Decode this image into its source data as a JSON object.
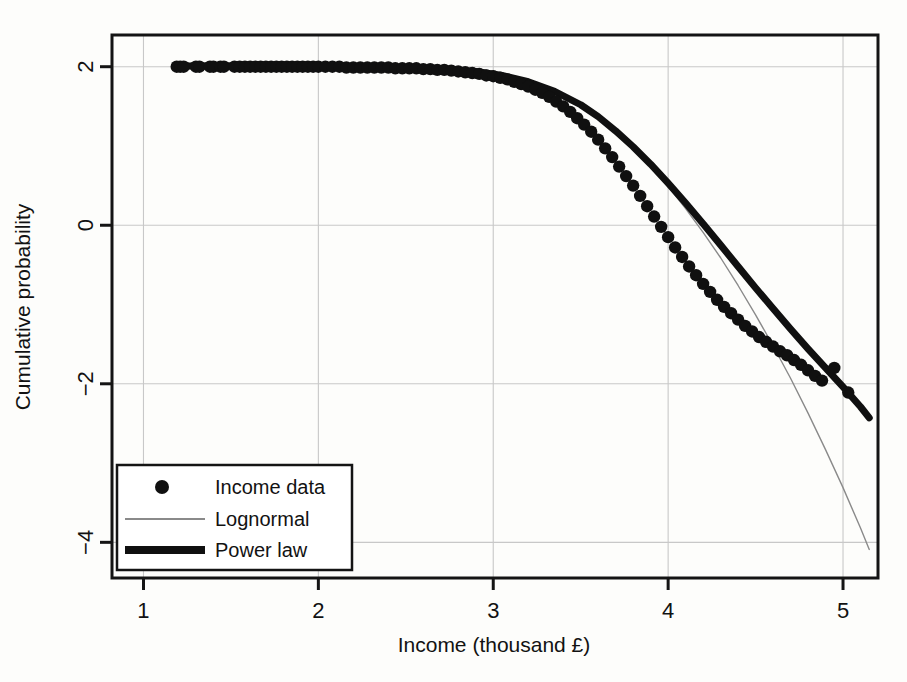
{
  "chart_data": {
    "type": "scatter",
    "title": "",
    "xlabel": "Income (thousand £)",
    "ylabel": "Cumulative probability",
    "xlim": [
      0.82,
      5.2
    ],
    "ylim": [
      -4.45,
      2.4
    ],
    "xticks": [
      1,
      2,
      3,
      4,
      5
    ],
    "yticks": [
      2,
      0,
      -2,
      -4
    ],
    "xticklabels": [
      "1",
      "2",
      "3",
      "4",
      "5"
    ],
    "yticklabels": [
      "2",
      "0",
      "−2",
      "−4"
    ],
    "grid": true,
    "grid_color": "#c8c8c8",
    "frame_color": "#141414",
    "background": "#fdfdfb",
    "legend": {
      "position": "bottom-left",
      "entries": [
        {
          "label": "Income data",
          "marker": "circle",
          "color": "#101010"
        },
        {
          "label": "Lognormal",
          "marker": "thin-line",
          "color": "#8a8a8a"
        },
        {
          "label": "Power law",
          "marker": "thick-line",
          "color": "#101010"
        }
      ]
    },
    "series": [
      {
        "name": "Income data",
        "type": "scatter",
        "marker": "circle",
        "color": "#101010",
        "points": [
          [
            1.19,
            2.0
          ],
          [
            1.21,
            2.0
          ],
          [
            1.23,
            2.0
          ],
          [
            1.3,
            2.0
          ],
          [
            1.32,
            2.0
          ],
          [
            1.38,
            2.0
          ],
          [
            1.4,
            2.0
          ],
          [
            1.44,
            2.0
          ],
          [
            1.46,
            2.0
          ],
          [
            1.52,
            2.0
          ],
          [
            1.55,
            2.0
          ],
          [
            1.58,
            2.0
          ],
          [
            1.61,
            2.0
          ],
          [
            1.64,
            2.0
          ],
          [
            1.67,
            2.0
          ],
          [
            1.7,
            2.0
          ],
          [
            1.73,
            2.0
          ],
          [
            1.76,
            2.0
          ],
          [
            1.79,
            2.0
          ],
          [
            1.82,
            2.0
          ],
          [
            1.85,
            2.0
          ],
          [
            1.88,
            2.0
          ],
          [
            1.91,
            2.0
          ],
          [
            1.94,
            2.0
          ],
          [
            1.97,
            2.0
          ],
          [
            2.0,
            2.0
          ],
          [
            2.04,
            2.0
          ],
          [
            2.08,
            2.0
          ],
          [
            2.12,
            2.0
          ],
          [
            2.16,
            1.99
          ],
          [
            2.2,
            1.99
          ],
          [
            2.24,
            1.99
          ],
          [
            2.28,
            1.99
          ],
          [
            2.32,
            1.99
          ],
          [
            2.36,
            1.99
          ],
          [
            2.4,
            1.99
          ],
          [
            2.44,
            1.98
          ],
          [
            2.48,
            1.98
          ],
          [
            2.52,
            1.98
          ],
          [
            2.56,
            1.98
          ],
          [
            2.6,
            1.97
          ],
          [
            2.64,
            1.97
          ],
          [
            2.68,
            1.96
          ],
          [
            2.72,
            1.96
          ],
          [
            2.76,
            1.95
          ],
          [
            2.8,
            1.94
          ],
          [
            2.84,
            1.93
          ],
          [
            2.88,
            1.92
          ],
          [
            2.92,
            1.91
          ],
          [
            2.96,
            1.89
          ],
          [
            3.0,
            1.88
          ],
          [
            3.04,
            1.86
          ],
          [
            3.08,
            1.84
          ],
          [
            3.12,
            1.81
          ],
          [
            3.16,
            1.78
          ],
          [
            3.2,
            1.75
          ],
          [
            3.24,
            1.71
          ],
          [
            3.28,
            1.67
          ],
          [
            3.32,
            1.62
          ],
          [
            3.36,
            1.56
          ],
          [
            3.4,
            1.5
          ],
          [
            3.44,
            1.43
          ],
          [
            3.48,
            1.35
          ],
          [
            3.52,
            1.27
          ],
          [
            3.56,
            1.18
          ],
          [
            3.6,
            1.08
          ],
          [
            3.64,
            0.97
          ],
          [
            3.68,
            0.86
          ],
          [
            3.72,
            0.74
          ],
          [
            3.76,
            0.62
          ],
          [
            3.8,
            0.5
          ],
          [
            3.84,
            0.37
          ],
          [
            3.88,
            0.24
          ],
          [
            3.92,
            0.11
          ],
          [
            3.96,
            -0.02
          ],
          [
            4.0,
            -0.15
          ],
          [
            4.04,
            -0.28
          ],
          [
            4.08,
            -0.4
          ],
          [
            4.12,
            -0.52
          ],
          [
            4.16,
            -0.63
          ],
          [
            4.2,
            -0.74
          ],
          [
            4.24,
            -0.84
          ],
          [
            4.28,
            -0.94
          ],
          [
            4.32,
            -1.03
          ],
          [
            4.36,
            -1.11
          ],
          [
            4.4,
            -1.19
          ],
          [
            4.44,
            -1.27
          ],
          [
            4.48,
            -1.34
          ],
          [
            4.52,
            -1.41
          ],
          [
            4.56,
            -1.47
          ],
          [
            4.6,
            -1.53
          ],
          [
            4.64,
            -1.59
          ],
          [
            4.68,
            -1.64
          ],
          [
            4.72,
            -1.7
          ],
          [
            4.76,
            -1.76
          ],
          [
            4.8,
            -1.83
          ],
          [
            4.84,
            -1.9
          ],
          [
            4.88,
            -1.96
          ],
          [
            4.95,
            -1.8
          ],
          [
            5.03,
            -2.11
          ]
        ]
      },
      {
        "name": "Lognormal",
        "type": "line",
        "color": "#8a8a8a",
        "linewidth": 1.4,
        "points": [
          [
            1.19,
            2.01
          ],
          [
            1.6,
            2.01
          ],
          [
            2.0,
            2.0
          ],
          [
            2.4,
            1.99
          ],
          [
            2.7,
            1.96
          ],
          [
            2.9,
            1.93
          ],
          [
            3.05,
            1.88
          ],
          [
            3.2,
            1.8
          ],
          [
            3.35,
            1.68
          ],
          [
            3.5,
            1.5
          ],
          [
            3.6,
            1.35
          ],
          [
            3.7,
            1.17
          ],
          [
            3.8,
            0.97
          ],
          [
            3.9,
            0.74
          ],
          [
            4.0,
            0.49
          ],
          [
            4.1,
            0.21
          ],
          [
            4.2,
            -0.09
          ],
          [
            4.3,
            -0.41
          ],
          [
            4.4,
            -0.76
          ],
          [
            4.5,
            -1.13
          ],
          [
            4.6,
            -1.52
          ],
          [
            4.7,
            -1.93
          ],
          [
            4.8,
            -2.37
          ],
          [
            4.9,
            -2.83
          ],
          [
            5.0,
            -3.31
          ],
          [
            5.1,
            -3.82
          ],
          [
            5.15,
            -4.09
          ]
        ]
      },
      {
        "name": "Power law",
        "type": "line",
        "color": "#101010",
        "linewidth": 7,
        "points": [
          [
            1.19,
            2.01
          ],
          [
            1.6,
            2.01
          ],
          [
            2.0,
            2.0
          ],
          [
            2.4,
            1.99
          ],
          [
            2.7,
            1.97
          ],
          [
            2.9,
            1.94
          ],
          [
            3.05,
            1.89
          ],
          [
            3.2,
            1.81
          ],
          [
            3.35,
            1.69
          ],
          [
            3.5,
            1.52
          ],
          [
            3.6,
            1.37
          ],
          [
            3.7,
            1.19
          ],
          [
            3.8,
            0.99
          ],
          [
            3.9,
            0.77
          ],
          [
            4.0,
            0.53
          ],
          [
            4.1,
            0.28
          ],
          [
            4.2,
            0.02
          ],
          [
            4.3,
            -0.25
          ],
          [
            4.4,
            -0.52
          ],
          [
            4.5,
            -0.79
          ],
          [
            4.6,
            -1.05
          ],
          [
            4.7,
            -1.31
          ],
          [
            4.8,
            -1.56
          ],
          [
            4.9,
            -1.8
          ],
          [
            5.0,
            -2.04
          ],
          [
            5.1,
            -2.29
          ],
          [
            5.15,
            -2.43
          ]
        ]
      }
    ]
  }
}
